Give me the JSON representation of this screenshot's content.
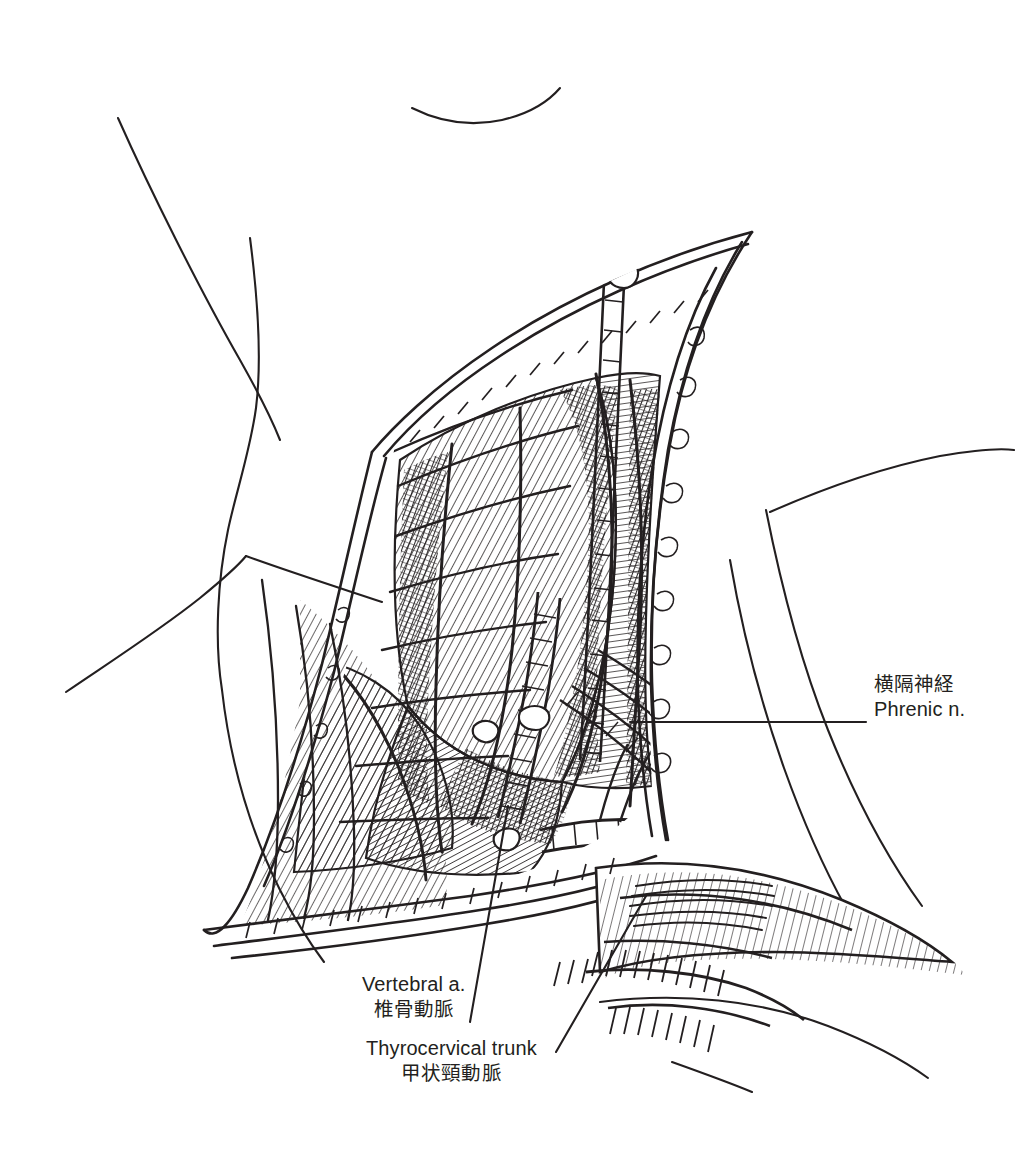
{
  "figure": {
    "style": "pen-and-ink line drawing with cross-hatching",
    "background_color": "#ffffff",
    "ink_color": "#231f20",
    "width": 1031,
    "height": 1156
  },
  "labels": [
    {
      "id": "phrenic",
      "ja": "横隔神経",
      "en": "Phrenic n.",
      "leader": "horizontal",
      "anchor_x": 630,
      "anchor_y": 722,
      "text_x": 874,
      "text_y": 672
    },
    {
      "id": "vertebral",
      "ja": "椎骨動脈",
      "en": "Vertebral a.",
      "leader": "diagonal",
      "anchor_x": 508,
      "anchor_y": 806,
      "text_x": 362,
      "text_y": 972
    },
    {
      "id": "thyrocervical",
      "ja": "甲状頸動脈",
      "en": "Thyrocervical trunk",
      "leader": "diagonal",
      "anchor_x": 640,
      "anchor_y": 900,
      "text_x": 366,
      "text_y": 1036
    }
  ]
}
